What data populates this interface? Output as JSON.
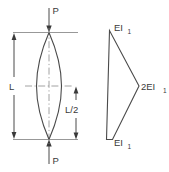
{
  "figure": {
    "background_color": "#ffffff",
    "line_color": "#4a4a4a",
    "text_color": "#3a3a3a"
  },
  "left_diagram": {
    "name": "buckled-column",
    "load_top_label": "P",
    "load_bottom_label": "P",
    "length_label": "L",
    "half_length_label": "L/2",
    "shape": "lenticular-column",
    "centerline_style": "dash-dot"
  },
  "right_diagram": {
    "name": "stiffness-distribution",
    "top_label_base": "EI",
    "top_label_sub": "1",
    "mid_label_base": "2EI",
    "mid_label_sub": "1",
    "bottom_label_base": "EI",
    "bottom_label_sub": "1",
    "shape": "triangular-taper"
  }
}
